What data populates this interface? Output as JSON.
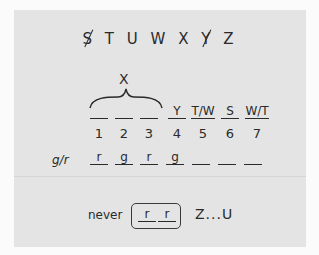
{
  "sequence": {
    "letters": [
      {
        "char": "S",
        "crossed": true
      },
      {
        "char": "T",
        "crossed": false
      },
      {
        "char": "U",
        "crossed": false
      },
      {
        "char": "W",
        "crossed": false
      },
      {
        "char": "X",
        "crossed": false
      },
      {
        "char": "Y",
        "crossed": true
      },
      {
        "char": "Z",
        "crossed": false
      }
    ]
  },
  "group": {
    "label": "X",
    "spans_positions": [
      1,
      2,
      3
    ]
  },
  "slots": {
    "values": [
      "",
      "",
      "",
      "Y",
      "T/W",
      "S",
      "W/T"
    ],
    "numbers": [
      "1",
      "2",
      "3",
      "4",
      "5",
      "6",
      "7"
    ]
  },
  "gr_row": {
    "label": "g/r",
    "values": [
      "r",
      "g",
      "r",
      "g",
      "",
      "",
      ""
    ]
  },
  "never_rule": {
    "label": "never",
    "boxed": [
      "r",
      "r"
    ],
    "tail": "Z...U"
  }
}
